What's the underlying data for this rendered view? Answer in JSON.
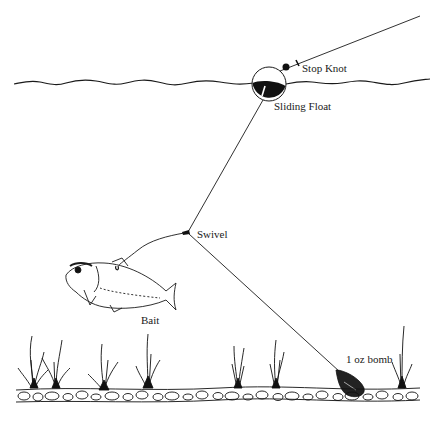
{
  "diagram": {
    "type": "fishing rig illustration",
    "labels": {
      "stop_knot": "Stop Knot",
      "sliding_float": "Sliding Float",
      "swivel": "Swivel",
      "bait": "Bait",
      "bomb": "1 oz bomb"
    },
    "colors": {
      "line": "#1a1a1a",
      "background": "#ffffff"
    }
  }
}
